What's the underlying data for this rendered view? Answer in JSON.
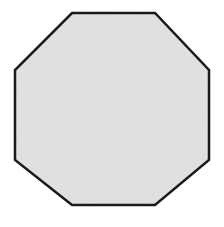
{
  "image": {
    "kind": "geometric-shape-figure",
    "width": 224,
    "height": 227,
    "background_color": "#ffffff",
    "caption": "",
    "labels": []
  },
  "shape": {
    "name": "octagon",
    "sides": 8,
    "regular": true,
    "fill_color": "#c8c8c8",
    "fill_texture": "fine-grain-noise",
    "stroke_color": "#1a1a1a",
    "stroke_width": 2.5,
    "bounding_box": {
      "left": 15,
      "top": 13,
      "right": 209,
      "bottom": 205,
      "width": 194,
      "height": 192
    },
    "center": {
      "x": 112,
      "y": 109
    },
    "vertices": [
      {
        "x": 72,
        "y": 13
      },
      {
        "x": 155,
        "y": 13
      },
      {
        "x": 209,
        "y": 70
      },
      {
        "x": 209,
        "y": 160
      },
      {
        "x": 155,
        "y": 205
      },
      {
        "x": 72,
        "y": 205
      },
      {
        "x": 15,
        "y": 160
      },
      {
        "x": 15,
        "y": 70
      }
    ],
    "points_attr": "72,13 155,13 209,70 209,160 155,205 72,205 15,160 15,70"
  },
  "texture": {
    "noise_base_color": "#c9c9c9",
    "noise_light_color": "#d6d6d6",
    "noise_dark_color": "#bcbcbc",
    "noise_seed": 7,
    "noise_frequency": 0.9,
    "noise_octaves": 4
  }
}
